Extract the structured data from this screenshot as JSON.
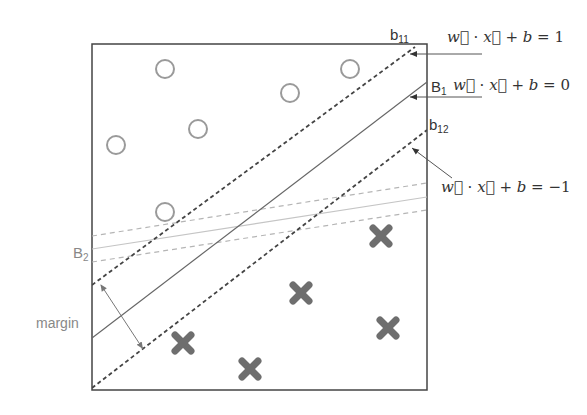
{
  "diagram": {
    "frame": {
      "x": 92,
      "y": 44,
      "width": 335,
      "height": 346
    },
    "circles": [
      {
        "cx": 165,
        "cy": 69
      },
      {
        "cx": 350,
        "cy": 69
      },
      {
        "cx": 290,
        "cy": 93
      },
      {
        "cx": 198,
        "cy": 129
      },
      {
        "cx": 116,
        "cy": 145
      },
      {
        "cx": 165,
        "cy": 212
      }
    ],
    "crosses": [
      {
        "cx": 381,
        "cy": 236
      },
      {
        "cx": 301,
        "cy": 293
      },
      {
        "cx": 388,
        "cy": 328
      },
      {
        "cx": 183,
        "cy": 343
      },
      {
        "cx": 250,
        "cy": 369
      }
    ],
    "labels": {
      "b11": "b",
      "b11_sub": "11",
      "B1": "B",
      "B1_sub": "1",
      "b12": "b",
      "b12_sub": "12",
      "B2": "B",
      "B2_sub": "2",
      "margin": "margin"
    },
    "equations": {
      "eq_plus_one": {
        "w": "w",
        "x": "x",
        "b": "b",
        "rhs": "1"
      },
      "eq_zero": {
        "w": "w",
        "x": "x",
        "b": "b",
        "rhs": "0"
      },
      "eq_minus_one": {
        "w": "w",
        "x": "x",
        "b": "b",
        "rhs": "−1"
      }
    },
    "colors": {
      "frame": "#444444",
      "circle_stroke": "#9a9a9a",
      "cross_fill": "#6e6e6e",
      "b1_lines": "#444444",
      "b2_lines": "#b5b5b5"
    }
  }
}
